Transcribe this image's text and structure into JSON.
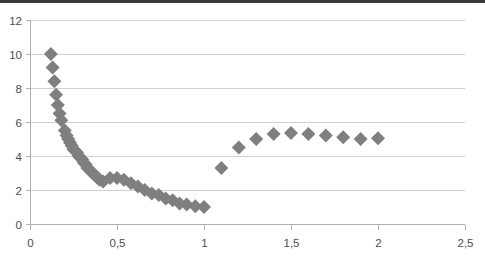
{
  "chart_data": {
    "type": "scatter",
    "title": "",
    "subtitle": "",
    "xlabel": "",
    "ylabel": "",
    "xlim": [
      0,
      2.5
    ],
    "ylim": [
      0,
      12
    ],
    "grid": true,
    "grid_axis": "y",
    "legend": "none",
    "legend_position": "none",
    "marker": {
      "shape": "diamond",
      "color": "#7f7f7f",
      "size": 7
    },
    "xticks": [
      0,
      0.5,
      1,
      1.5,
      2,
      2.5
    ],
    "xtick_labels": [
      "0",
      "0,5",
      "1",
      "1,5",
      "2",
      "2,5"
    ],
    "yticks": [
      0,
      2,
      4,
      6,
      8,
      10,
      12
    ],
    "ytick_labels": [
      "0",
      "2",
      "4",
      "6",
      "8",
      "10",
      "12"
    ],
    "decimal_separator": ",",
    "series": [
      {
        "name": "series-1",
        "points": [
          [
            0.12,
            10.0
          ],
          [
            0.13,
            9.2
          ],
          [
            0.14,
            8.4
          ],
          [
            0.15,
            7.6
          ],
          [
            0.16,
            7.0
          ],
          [
            0.17,
            6.5
          ],
          [
            0.18,
            6.1
          ],
          [
            0.2,
            5.5
          ],
          [
            0.21,
            5.2
          ],
          [
            0.22,
            5.0
          ],
          [
            0.23,
            4.8
          ],
          [
            0.24,
            4.6
          ],
          [
            0.25,
            4.4
          ],
          [
            0.26,
            4.3
          ],
          [
            0.27,
            4.2
          ],
          [
            0.28,
            4.0
          ],
          [
            0.29,
            3.9
          ],
          [
            0.3,
            3.8
          ],
          [
            0.31,
            3.6
          ],
          [
            0.32,
            3.5
          ],
          [
            0.33,
            3.3
          ],
          [
            0.34,
            3.2
          ],
          [
            0.35,
            3.1
          ],
          [
            0.36,
            3.0
          ],
          [
            0.37,
            2.9
          ],
          [
            0.38,
            2.8
          ],
          [
            0.39,
            2.7
          ],
          [
            0.4,
            2.6
          ],
          [
            0.42,
            2.5
          ],
          [
            0.46,
            2.7
          ],
          [
            0.5,
            2.7
          ],
          [
            0.54,
            2.6
          ],
          [
            0.58,
            2.4
          ],
          [
            0.62,
            2.2
          ],
          [
            0.66,
            2.0
          ],
          [
            0.7,
            1.8
          ],
          [
            0.74,
            1.7
          ],
          [
            0.78,
            1.5
          ],
          [
            0.82,
            1.4
          ],
          [
            0.86,
            1.2
          ],
          [
            0.9,
            1.15
          ],
          [
            0.95,
            1.05
          ],
          [
            1.0,
            1.0
          ],
          [
            1.1,
            3.3
          ],
          [
            1.2,
            4.5
          ],
          [
            1.3,
            5.0
          ],
          [
            1.4,
            5.3
          ],
          [
            1.5,
            5.35
          ],
          [
            1.6,
            5.3
          ],
          [
            1.7,
            5.2
          ],
          [
            1.8,
            5.1
          ],
          [
            1.9,
            5.0
          ],
          [
            2.0,
            5.05
          ]
        ]
      }
    ]
  },
  "colors": {
    "marker": "#7f7f7f",
    "grid": "#d0d0d0",
    "axis": "#b0b0b0",
    "tick_text": "#4d4d4d",
    "background": "#ffffff",
    "top_band": "#3a3a3a"
  }
}
